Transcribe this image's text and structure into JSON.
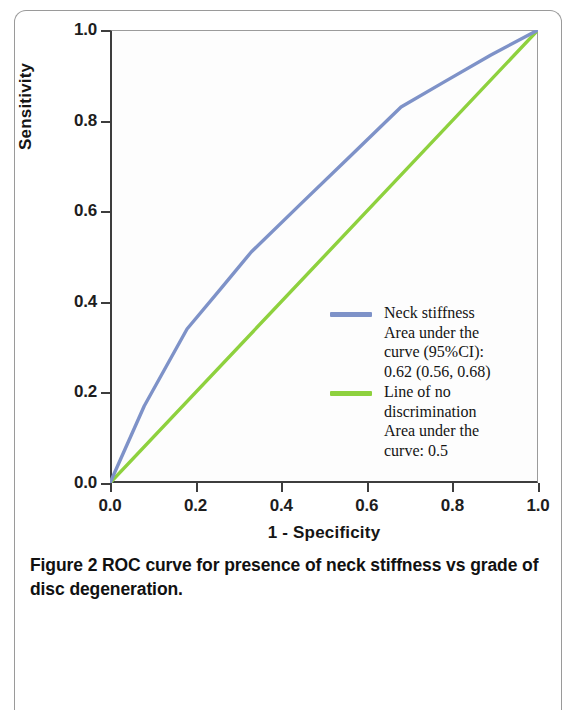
{
  "figure": {
    "caption_label": "Figure 2",
    "caption_text": "ROC curve for presence of neck stiffness vs grade of disc degeneration."
  },
  "axes": {
    "x_title": "1 - Specificity",
    "y_title": "Sensitivity",
    "x_ticks": [
      "0.0",
      "0.2",
      "0.4",
      "0.6",
      "0.8",
      "1.0"
    ],
    "y_ticks": [
      "0.0",
      "0.2",
      "0.4",
      "0.6",
      "0.8",
      "1.0"
    ]
  },
  "legend": {
    "entries": [
      {
        "label": "Neck stiffness\nArea under the\ncurve (95%CI):\n0.62 (0.56, 0.68)",
        "color": "#7e92c8"
      },
      {
        "label": "Line of no\ndiscrimination\nArea under the\ncurve: 0.5",
        "color": "#8ed13e"
      }
    ]
  },
  "chart_data": {
    "type": "line",
    "title": "ROC curve for presence of neck stiffness vs grade of disc degeneration",
    "xlabel": "1 - Specificity",
    "ylabel": "Sensitivity",
    "xlim": [
      0.0,
      1.0
    ],
    "ylim": [
      0.0,
      1.0
    ],
    "xticks": [
      0.0,
      0.2,
      0.4,
      0.6,
      0.8,
      1.0
    ],
    "yticks": [
      0.0,
      0.2,
      0.4,
      0.6,
      0.8,
      1.0
    ],
    "grid": false,
    "legend_position": "inside-right",
    "series": [
      {
        "name": "Neck stiffness",
        "color": "#7e92c8",
        "auc": 0.62,
        "auc_ci": [
          0.56,
          0.68
        ],
        "auc_label": "Area under the curve (95%CI): 0.62 (0.56, 0.68)",
        "x": [
          0.0,
          0.08,
          0.18,
          0.26,
          0.33,
          0.45,
          0.56,
          0.68,
          0.78,
          0.89,
          1.0
        ],
        "y": [
          0.0,
          0.17,
          0.34,
          0.43,
          0.51,
          0.62,
          0.72,
          0.83,
          0.885,
          0.945,
          1.0
        ]
      },
      {
        "name": "Line of no discrimination",
        "color": "#8ed13e",
        "auc": 0.5,
        "auc_label": "Area under the curve: 0.5",
        "x": [
          0.0,
          1.0
        ],
        "y": [
          0.0,
          1.0
        ]
      }
    ]
  }
}
